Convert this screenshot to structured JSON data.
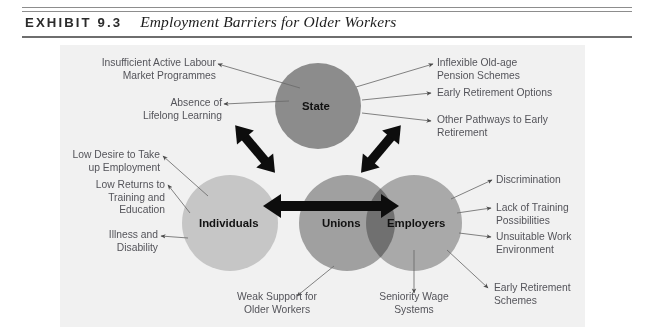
{
  "header": {
    "kicker": "EXHIBIT 9.3",
    "title": "Employment Barriers for Older Workers"
  },
  "diagram": {
    "type": "relationship-diagram",
    "nodes": [
      {
        "id": "state",
        "label": "State",
        "color": "#8c8c8c"
      },
      {
        "id": "individuals",
        "label": "Individuals",
        "color": "#c6c6c6"
      },
      {
        "id": "unions",
        "label": "Unions",
        "color": "#a0a0a0"
      },
      {
        "id": "employers",
        "label": "Employers",
        "color": "#b3b3b3"
      }
    ],
    "links": [
      {
        "from": "state",
        "to": "individuals",
        "style": "thick-double-arrow"
      },
      {
        "from": "state",
        "to": "employers",
        "style": "thick-double-arrow"
      },
      {
        "from": "individuals",
        "to": "employers",
        "style": "thick-double-arrow"
      }
    ],
    "barriers": {
      "state_left": [
        "Insufficient Active Labour\nMarket Programmes",
        "Absence of\nLifelong Learning"
      ],
      "state_right": [
        "Inflexible Old-age\nPension Schemes",
        "Early Retirement Options",
        "Other Pathways to Early\nRetirement"
      ],
      "individuals_left": [
        "Low Desire to Take\nup Employment",
        "Low Returns to\nTraining and\nEducation",
        "Illness and\nDisability"
      ],
      "employers_right": [
        "Discrimination",
        "Lack of Training\nPossibilities",
        "Unsuitable Work\nEnvironment",
        "Early Retirement\nSchemes"
      ],
      "unions_below": [
        "Weak Support for\nOlder Workers",
        "Seniority Wage\nSystems"
      ]
    }
  }
}
